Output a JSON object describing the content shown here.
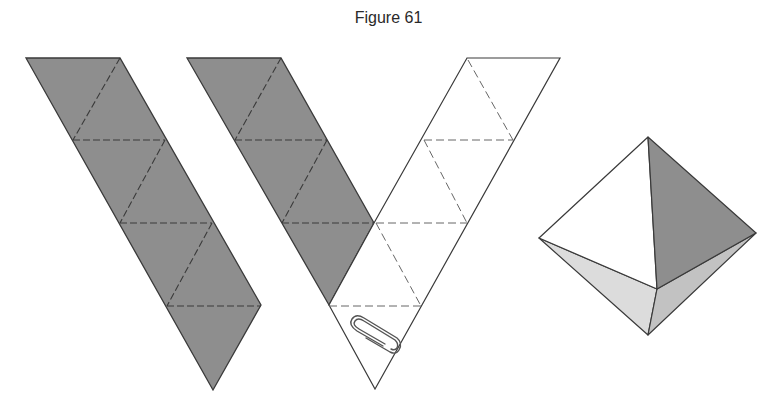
{
  "figure": {
    "title": "Figure 61"
  },
  "colors": {
    "shaded_face": "#8e8e8e",
    "light_face": "#d9d9d9",
    "mid_face": "#bdbdbd",
    "edge": "#3a3a3a",
    "dashed_fold": "#555555",
    "white_face": "#ffffff"
  },
  "diagram": {
    "parts": [
      {
        "name": "shaded-strip-left",
        "description": "strip of 5 shaded equilateral triangles with dashed fold lines"
      },
      {
        "name": "shaded-strip-middle",
        "description": "strip of 4 shaded triangles joined to white strip forming a V"
      },
      {
        "name": "white-strip",
        "description": "strip of 5 white triangles with dashed fold lines, held with a paper clip"
      },
      {
        "name": "paper-clip",
        "description": "paper clip fastening the bottom triangle"
      },
      {
        "name": "octahedron",
        "description": "assembled octahedron with white, shaded and light faces"
      }
    ]
  }
}
